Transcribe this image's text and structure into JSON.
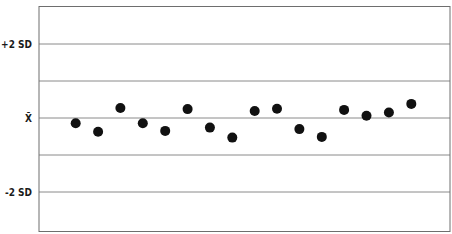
{
  "chart_data": {
    "type": "scatter",
    "title": "",
    "xlabel": "",
    "ylabel": "",
    "y_unit": "SD from mean",
    "ylim": [
      -3.05,
      3.0
    ],
    "grid": true,
    "gridlines_sd": [
      2,
      1,
      0,
      -1,
      -2
    ],
    "tick_labels": [
      {
        "sd": 2,
        "label": "+2 SD"
      },
      {
        "sd": 0,
        "label": "X̄"
      },
      {
        "sd": -2,
        "label": "-2 SD"
      }
    ],
    "x": [
      1,
      2,
      3,
      4,
      5,
      6,
      7,
      8,
      9,
      10,
      11,
      12,
      13,
      14,
      15,
      16
    ],
    "values": [
      -0.14,
      -0.37,
      0.27,
      -0.14,
      -0.35,
      0.24,
      -0.26,
      -0.53,
      0.19,
      0.25,
      -0.3,
      -0.51,
      0.22,
      0.06,
      0.15,
      0.38
    ],
    "legend": null
  },
  "colors": {
    "background": "#ffffff",
    "border": "#6e6e6e",
    "gridline": "#8a8a8a",
    "point": "#111111",
    "label": "#1a1a1a"
  }
}
